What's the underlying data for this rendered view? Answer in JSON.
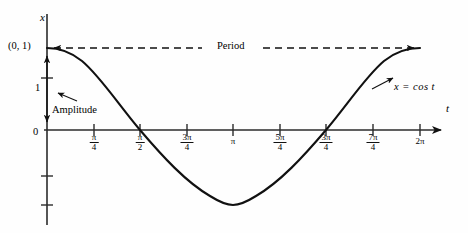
{
  "figure": {
    "curve_label": "x = cos t",
    "period_label": "Period",
    "amplitude_label": "Amplitude",
    "point_label": "(0, 1)",
    "y_axis_label": "x",
    "x_axis_label": "t",
    "y_tick_one": "1",
    "origin_label": "0",
    "stroke_color": "#111111",
    "axis_color": "#2b2b2b"
  },
  "ticks": [
    {
      "num": "π",
      "den": "4",
      "plain": null,
      "x_px": 94
    },
    {
      "num": "π",
      "den": "2",
      "plain": null,
      "x_px": 140
    },
    {
      "num": "3π",
      "den": "4",
      "plain": null,
      "x_px": 187
    },
    {
      "num": null,
      "den": null,
      "plain": "π",
      "x_px": 233
    },
    {
      "num": "5π",
      "den": "4",
      "plain": null,
      "x_px": 280
    },
    {
      "num": "3π",
      "den": "4",
      "plain": null,
      "x_px": 326
    },
    {
      "num": "7π",
      "den": "4",
      "plain": null,
      "x_px": 373
    },
    {
      "num": null,
      "den": null,
      "plain": "2π",
      "x_px": 420
    }
  ],
  "chart_data": {
    "type": "line",
    "title": "",
    "xlabel": "t",
    "ylabel": "x",
    "function": "x = cos t",
    "xlim": [
      0,
      6.283185
    ],
    "ylim": [
      -1,
      1
    ],
    "grid": false,
    "legend": "none",
    "x_tick_labels": [
      "π/4",
      "π/2",
      "3π/4",
      "π",
      "5π/4",
      "3π/4",
      "7π/4",
      "2π"
    ],
    "x_tick_values": [
      0.785398,
      1.570796,
      2.356194,
      3.141593,
      3.926991,
      4.712389,
      5.497787,
      6.283185
    ],
    "y_tick_labels": [
      "0",
      "1"
    ],
    "y_tick_values": [
      0,
      1
    ],
    "x": [
      0,
      0.3927,
      0.7854,
      1.1781,
      1.5708,
      1.9635,
      2.3562,
      2.7489,
      3.1416,
      3.5343,
      3.927,
      4.3197,
      4.7124,
      5.1051,
      5.4978,
      5.8905,
      6.2832
    ],
    "values": [
      1,
      0.9239,
      0.7071,
      0.3827,
      0,
      -0.3827,
      -0.7071,
      -0.9239,
      -1,
      -0.9239,
      -0.7071,
      -0.3827,
      0,
      0.3827,
      0.7071,
      0.9239,
      1
    ],
    "annotations": [
      {
        "text": "(0, 1)",
        "x": 0,
        "y": 1
      },
      {
        "text": "Period",
        "x": 3.141593,
        "y": 1,
        "kind": "double-arrow-span",
        "span": [
          0,
          6.283185
        ]
      },
      {
        "text": "Amplitude",
        "x": 0,
        "y": 0.5,
        "kind": "double-arrow-span",
        "span_y": [
          0,
          1
        ]
      },
      {
        "text": "x = cos t",
        "x": 5.6,
        "y": 0.62,
        "kind": "curve-label"
      }
    ]
  }
}
